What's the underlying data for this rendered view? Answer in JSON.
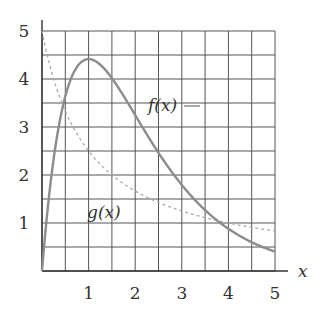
{
  "chart_data": {
    "type": "line",
    "title": "",
    "xlabel": "x",
    "ylabel": "",
    "xlim": [
      0,
      5
    ],
    "ylim": [
      0,
      5
    ],
    "grid": true,
    "grid_step": 0.5,
    "x_ticks": [
      "1",
      "2",
      "3",
      "4",
      "5"
    ],
    "y_ticks": [
      "1",
      "2",
      "3",
      "4",
      "5"
    ],
    "series": [
      {
        "name": "f(x)",
        "style": "solid",
        "color": "#8a8a8a",
        "x": [
          0,
          0.25,
          0.5,
          0.75,
          1,
          1.5,
          2,
          2.5,
          3,
          3.5,
          4,
          4.5,
          5
        ],
        "values": [
          0,
          2.34,
          3.64,
          4.25,
          4.41,
          4.02,
          3.25,
          2.46,
          1.79,
          1.27,
          0.88,
          0.6,
          0.4
        ]
      },
      {
        "name": "g(x)",
        "style": "dashed",
        "color": "#a8a8a8",
        "x": [
          0,
          0.5,
          1,
          1.5,
          2,
          2.5,
          3,
          3.5,
          4,
          4.5,
          5
        ],
        "values": [
          5.0,
          3.33,
          2.5,
          2.0,
          1.67,
          1.43,
          1.25,
          1.11,
          1.0,
          0.91,
          0.83
        ]
      }
    ],
    "annotations": [
      {
        "text": "f(x)",
        "near": [
          2.6,
          3.35
        ]
      },
      {
        "text": "g(x)",
        "near": [
          1.5,
          1.2
        ]
      }
    ]
  },
  "labels": {
    "f": "f(x)",
    "g": "g(x)",
    "xaxis": "x"
  }
}
